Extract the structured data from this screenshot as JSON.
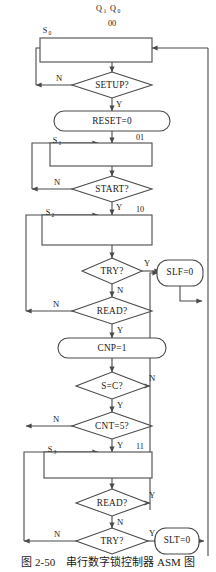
{
  "figure": {
    "caption_number": "图 2-50",
    "caption_title": "串行数字锁控制器 ASM 图",
    "header_register": "Q",
    "header_sub_hi": "1",
    "header_sub_lo": "0",
    "colors": {
      "stroke": "#4a4a4a",
      "text": "#1a1a1a",
      "background": "#ffffff"
    }
  },
  "states": [
    {
      "id": "s0",
      "name": "S",
      "subscript": "0",
      "code": "00"
    },
    {
      "id": "s1",
      "name": "S",
      "subscript": "1",
      "code": "01"
    },
    {
      "id": "s2",
      "name": "S",
      "subscript": "2",
      "code": "10"
    },
    {
      "id": "s3",
      "name": "S",
      "subscript": "3",
      "code": "11"
    }
  ],
  "decisions": [
    {
      "id": "setup",
      "text": "SETUP?",
      "no": "N",
      "yes": "Y"
    },
    {
      "id": "start",
      "text": "START?",
      "no": "N",
      "yes": "Y"
    },
    {
      "id": "try1",
      "text": "TRY?",
      "no": "N",
      "yes": "Y"
    },
    {
      "id": "read1",
      "text": "READ?",
      "no": "N",
      "yes": "Y"
    },
    {
      "id": "seqc",
      "text": "S=C?",
      "no": "N",
      "yes": "Y"
    },
    {
      "id": "cnt5",
      "text": "CNT=5?",
      "no": "N",
      "yes": "Y"
    },
    {
      "id": "read2",
      "text": "READ?",
      "no": "N",
      "yes": "Y"
    },
    {
      "id": "try2",
      "text": "TRY?",
      "no": "N",
      "yes": "Y"
    }
  ],
  "outputs": [
    {
      "id": "reset",
      "text": "RESET=0"
    },
    {
      "id": "cnp",
      "text": "CNP=1"
    },
    {
      "id": "slf",
      "text": "SLF=0"
    },
    {
      "id": "slt",
      "text": "SLT=0"
    }
  ]
}
